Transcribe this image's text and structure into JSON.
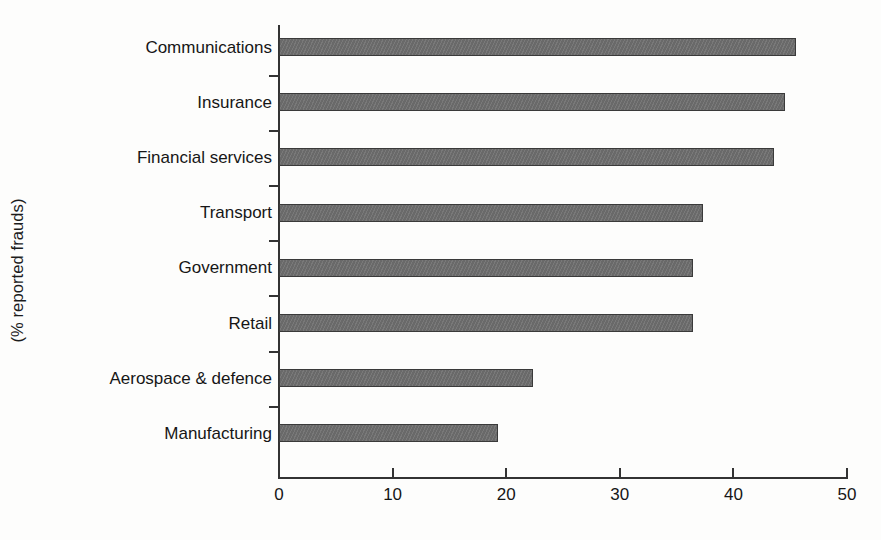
{
  "chart_data": {
    "type": "bar",
    "orientation": "horizontal",
    "title": "",
    "subtitle": "",
    "xlabel": "",
    "ylabel": "(% reported frauds)",
    "categories": [
      "Communications",
      "Insurance",
      "Financial services",
      "Transport",
      "Government",
      "Retail",
      "Aerospace & defence",
      "Manufacturing"
    ],
    "values": [
      45.5,
      44.5,
      43.6,
      37.3,
      36.4,
      36.4,
      22.4,
      19.3
    ],
    "xlim": [
      0,
      50
    ],
    "xticks": [
      0,
      10,
      20,
      30,
      40,
      50
    ],
    "xtick_labels": [
      "0",
      "10",
      "20",
      "30",
      "40",
      "50"
    ],
    "grid": false,
    "legend": false,
    "legend_position": "none",
    "bar_color": "#6f6f6f",
    "bar_border_color": "#3a3a3a",
    "axis_color": "#333333",
    "background_color": "#fdfdfc",
    "text_color": "#161616"
  },
  "axes": {
    "y_title": "(% reported frauds)"
  }
}
